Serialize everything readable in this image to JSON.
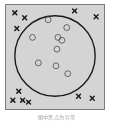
{
  "figure": {
    "caption": "图中黑点为异常",
    "frame": {
      "background_color": "#d4d4d4",
      "border_color": "#7b7b7b",
      "x": 5,
      "y": 4,
      "width": 100,
      "height": 106
    }
  },
  "chart_data": {
    "type": "scatter",
    "title": "",
    "subtitle": "",
    "xlabel": "",
    "ylabel": "",
    "xlim": [
      0,
      100
    ],
    "ylim": [
      0,
      106
    ],
    "grid": false,
    "legend": null,
    "annotations": [
      {
        "name": "cluster-boundary-circle",
        "shape": "circle",
        "cx": 50,
        "cy": 52,
        "r": 41,
        "stroke": "#1a1a1a",
        "stroke_width": 1.4,
        "fill": "none"
      }
    ],
    "series": [
      {
        "name": "inliers",
        "marker": "open-circle",
        "marker_size": 3.0,
        "color": "#555555",
        "fill": "none",
        "count": 9,
        "points": [
          {
            "x": 43,
            "y": 15
          },
          {
            "x": 62,
            "y": 23
          },
          {
            "x": 27,
            "y": 33
          },
          {
            "x": 53,
            "y": 33
          },
          {
            "x": 57,
            "y": 36
          },
          {
            "x": 52,
            "y": 45
          },
          {
            "x": 33,
            "y": 59
          },
          {
            "x": 51,
            "y": 62
          },
          {
            "x": 63,
            "y": 70
          }
        ]
      },
      {
        "name": "outliers",
        "marker": "x-cross",
        "marker_size": 4.0,
        "color": "#1a1a1a",
        "stroke_width": 1.5,
        "count": 11,
        "points": [
          {
            "x": 9,
            "y": 8
          },
          {
            "x": 19,
            "y": 13
          },
          {
            "x": 11,
            "y": 24
          },
          {
            "x": 70,
            "y": 6
          },
          {
            "x": 92,
            "y": 12
          },
          {
            "x": 13,
            "y": 88
          },
          {
            "x": 7,
            "y": 97
          },
          {
            "x": 17,
            "y": 97
          },
          {
            "x": 23,
            "y": 99
          },
          {
            "x": 74,
            "y": 93
          },
          {
            "x": 88,
            "y": 95
          }
        ]
      }
    ]
  }
}
